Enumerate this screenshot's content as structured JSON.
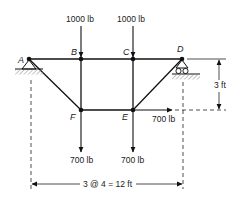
{
  "nodes": {
    "A": {
      "label": "A"
    },
    "B": {
      "label": "B"
    },
    "C": {
      "label": "C"
    },
    "D": {
      "label": "D"
    },
    "E": {
      "label": "E"
    },
    "F": {
      "label": "F"
    }
  },
  "loads": {
    "B_vertical": "1000 lb",
    "C_vertical": "1000 lb",
    "F_vertical": "700 lb",
    "E_vertical": "700 lb",
    "E_horizontal": "700 lb"
  },
  "dimensions": {
    "height": "3 ft",
    "span": "3 @ 4 = 12 ft"
  },
  "supports": {
    "A": "pin-support",
    "D": "roller-support"
  }
}
